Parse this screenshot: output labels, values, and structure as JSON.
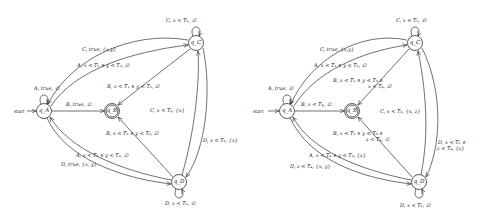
{
  "diagrams": [
    {
      "nodes": {
        "qA": "q_A",
        "qB": "q_B",
        "qC": "q_C",
        "qD": "q_D"
      },
      "start_label": "start",
      "edges": {
        "A_self": "A, true, ∅",
        "AB": "B, true, ∅",
        "CA": "C, true, {x,y}",
        "AC": "A, x < T₁ ∧ y < T₂, ∅",
        "CB": "B, x < T₁ ∧ y < T₂, ∅",
        "C_self": "C, x < T₁, ∅",
        "DC_label": "C, x < T₂, {x}",
        "CD_label": "D, x < T₁, {x}",
        "DB": "B, x < T₂ ∧ y < T₂, ∅",
        "DA": "A, x < T₂ ∧ y < T₂, ∅",
        "AD": "D, true, {x, y}",
        "D_self": "D, x < T₂, ∅"
      }
    },
    {
      "nodes": {
        "qA": "q_A",
        "qB": "q_B",
        "qC": "q_C",
        "qD": "q_D"
      },
      "start_label": "start",
      "edges": {
        "A_self": "A, true, ∅",
        "AB": "B, x < T₄, ∅",
        "CA": "C, true, {x,y}",
        "AC": "A, x < T₁ ∧ y < T₂, ∅",
        "CB_1": "B, x < T₁ ∧ y < T₃ ∧",
        "CB_2": "x < T₄, ∅",
        "C_self": "C, x < T₁, ∅",
        "DC_label": "C, x < T₃, {x, z}",
        "CD_1": "D, x < T₁ ∧",
        "CD_2": "z < T₄, {z}",
        "DB_1": "B, x < T₂ ∧ y < T₃ ∧",
        "DB_2": "z < T₄, ∅",
        "DA": "A, x < T₄ ∧ y < T₃, {z}",
        "AD": "D, z < T₄, {x, y}",
        "D_self": "D, x < T₂, ∅"
      }
    }
  ]
}
